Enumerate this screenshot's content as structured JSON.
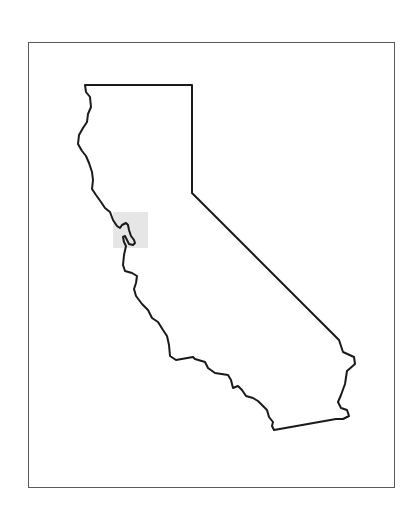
{
  "map": {
    "region": "California",
    "description": "State outline map with a highlighted area near the San Francisco Bay",
    "frame": {
      "x": 28,
      "y": 42,
      "width": 367,
      "height": 446,
      "stroke": "#5a5a5a"
    },
    "outline": {
      "stroke": "#1a1a1a",
      "stroke_width": 2,
      "fill": "#ffffff"
    },
    "highlight": {
      "label": "San Francisco Bay Area",
      "x": 113,
      "y": 212,
      "width": 35,
      "height": 36,
      "fill": "#e6e6e6"
    }
  }
}
